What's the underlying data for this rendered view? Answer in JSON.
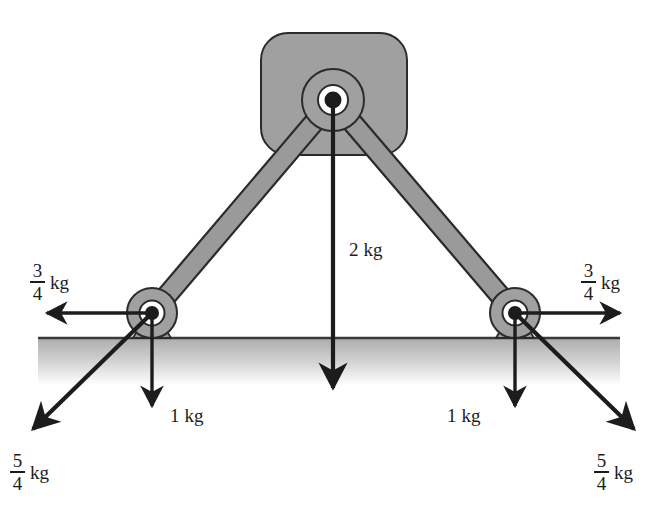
{
  "figure": {
    "colors": {
      "ink": "#1c1c1c",
      "strut_fill": "#9a9a9a",
      "strut_stroke": "#2b2b2b",
      "block_fill": "#a0a0a0",
      "ground_line": "#3a3a3a",
      "ground_shade": "#b8b8b8",
      "hub_white": "#ffffff",
      "background": "#ffffff"
    },
    "ground": {
      "label": "ground-surface",
      "y": 338,
      "x_start": 38,
      "x_end": 620
    },
    "joints": [
      {
        "name": "apex-pivot",
        "x": 333,
        "y": 100
      },
      {
        "name": "left-pin-joint",
        "x": 152,
        "y": 313
      },
      {
        "name": "right-pin-joint",
        "x": 515,
        "y": 313
      }
    ],
    "labels": {
      "center_load": {
        "value": "2",
        "unit": "kg",
        "is_fraction": false
      },
      "left_horizontal": {
        "numerator": "3",
        "denominator": "4",
        "unit": "kg",
        "is_fraction": true
      },
      "right_horizontal": {
        "numerator": "3",
        "denominator": "4",
        "unit": "kg",
        "is_fraction": true
      },
      "left_vertical": {
        "value": "1",
        "unit": "kg",
        "is_fraction": false
      },
      "right_vertical": {
        "value": "1",
        "unit": "kg",
        "is_fraction": false
      },
      "left_diagonal": {
        "numerator": "5",
        "denominator": "4",
        "unit": "kg",
        "is_fraction": true
      },
      "right_diagonal": {
        "numerator": "5",
        "denominator": "4",
        "unit": "kg",
        "is_fraction": true
      }
    },
    "forces": [
      {
        "name": "center-weight-arrow",
        "from": [
          333,
          108
        ],
        "to": [
          333,
          393
        ],
        "direction": "down",
        "magnitude": "2 kg"
      },
      {
        "name": "left-horizontal-reaction-arrow",
        "from": [
          152,
          313
        ],
        "to": [
          40,
          313
        ],
        "direction": "left",
        "magnitude": "3/4 kg"
      },
      {
        "name": "right-horizontal-reaction-arrow",
        "from": [
          515,
          313
        ],
        "to": [
          627,
          313
        ],
        "direction": "right",
        "magnitude": "3/4 kg"
      },
      {
        "name": "left-vertical-reaction-arrow",
        "from": [
          152,
          313
        ],
        "to": [
          152,
          412
        ],
        "direction": "down",
        "magnitude": "1 kg"
      },
      {
        "name": "right-vertical-reaction-arrow",
        "from": [
          515,
          313
        ],
        "to": [
          515,
          412
        ],
        "direction": "down",
        "magnitude": "1 kg"
      },
      {
        "name": "left-resultant-arrow",
        "from": [
          152,
          313
        ],
        "to": [
          25,
          437
        ],
        "direction": "down-left",
        "magnitude": "5/4 kg"
      },
      {
        "name": "right-resultant-arrow",
        "from": [
          515,
          313
        ],
        "to": [
          642,
          437
        ],
        "direction": "down-right",
        "magnitude": "5/4 kg"
      }
    ]
  }
}
